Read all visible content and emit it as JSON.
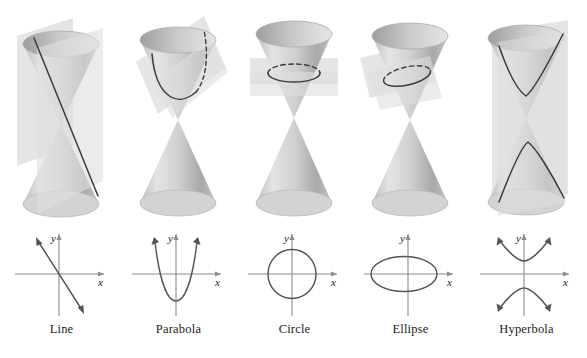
{
  "figure": {
    "columns": [
      {
        "id": "line",
        "label": "Line",
        "cone": {
          "plane_name": "cutting-plane-vertical-through-apex",
          "plane_orientation": "vertical, passing through the apex",
          "curve_name": "intersection-line",
          "curve_type": "line",
          "dashed_hidden_part": false
        },
        "graph": {
          "x_axis_label": "x",
          "y_axis_label": "y",
          "curve_type": "line",
          "curve_description": "straight line with negative slope through the origin, arrowheads at both ends",
          "slope": -2.1,
          "intercept": 0
        }
      },
      {
        "id": "parabola",
        "label": "Parabola",
        "cone": {
          "plane_name": "cutting-plane-parallel-to-side",
          "plane_orientation": "tilted, parallel to a generator of the cone",
          "curve_name": "intersection-parabola",
          "curve_type": "parabola",
          "dashed_hidden_part": true
        },
        "graph": {
          "x_axis_label": "x",
          "y_axis_label": "y",
          "curve_type": "parabola",
          "curve_description": "upward-opening parabola with vertex below the x-axis, arrowheads at both ends",
          "vertex": [
            0,
            -0.85
          ],
          "opens": "up"
        }
      },
      {
        "id": "circle",
        "label": "Circle",
        "cone": {
          "plane_name": "cutting-plane-horizontal",
          "plane_orientation": "horizontal, perpendicular to the axis",
          "curve_name": "intersection-circle",
          "curve_type": "circle",
          "dashed_hidden_part": true
        },
        "graph": {
          "x_axis_label": "x",
          "y_axis_label": "y",
          "curve_type": "circle",
          "curve_description": "circle centered at the origin",
          "center": [
            0,
            0
          ],
          "radius": 1
        }
      },
      {
        "id": "ellipse",
        "label": "Ellipse",
        "cone": {
          "plane_name": "cutting-plane-oblique",
          "plane_orientation": "oblique, cutting one nappe completely",
          "curve_name": "intersection-ellipse",
          "curve_type": "ellipse",
          "dashed_hidden_part": true
        },
        "graph": {
          "x_axis_label": "x",
          "y_axis_label": "y",
          "curve_type": "ellipse",
          "curve_description": "horizontally elongated ellipse centered at the origin",
          "center": [
            0,
            0
          ],
          "semi_major_x": 1.55,
          "semi_minor_y": 0.82
        }
      },
      {
        "id": "hyperbola",
        "label": "Hyperbola",
        "cone": {
          "plane_name": "cutting-plane-vertical-both-nappes",
          "plane_orientation": "vertical, cutting both nappes",
          "curve_name": "intersection-hyperbola",
          "curve_type": "hyperbola",
          "dashed_hidden_part": false
        },
        "graph": {
          "x_axis_label": "x",
          "y_axis_label": "y",
          "curve_type": "hyperbola",
          "curve_description": "vertical hyperbola with two branches opening up and down, arrowheads on all four ends",
          "center": [
            0,
            0
          ],
          "opens": "up-down",
          "vertices": [
            [
              0,
              0.55
            ],
            [
              0,
              -0.55
            ]
          ]
        }
      }
    ],
    "colors": {
      "cone_light": "#e8e8e8",
      "cone_mid": "#c9c9c9",
      "cone_dark": "#9a9a9a",
      "plane_fill": "#e2e2e2",
      "curve_stroke": "#3a3a3a",
      "axis_stroke": "#8c8c8c",
      "graph_curve_stroke": "#555555",
      "label_text": "#1a1a1a",
      "background": "#ffffff"
    }
  }
}
